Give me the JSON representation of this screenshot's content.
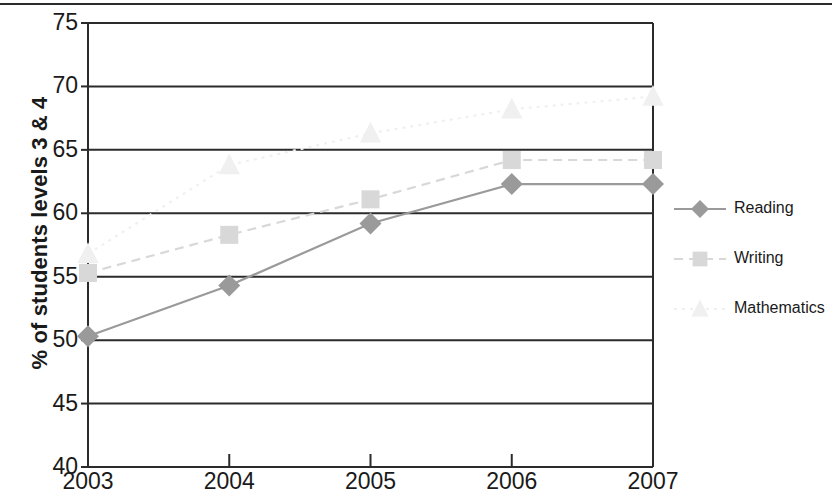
{
  "chart_data": {
    "type": "line",
    "title": "",
    "xlabel": "",
    "ylabel": "% of students levels 3 & 4",
    "categories": [
      "2003",
      "2004",
      "2005",
      "2006",
      "2007"
    ],
    "xticklabels": [
      "2003",
      "2004",
      "2005",
      "2006",
      "2007"
    ],
    "yticklabels": [
      "40",
      "45",
      "50",
      "55",
      "60",
      "65",
      "70",
      "75"
    ],
    "yticks": [
      40,
      45,
      50,
      55,
      60,
      65,
      70,
      75
    ],
    "ylim": [
      40,
      75
    ],
    "grid": "horizontal",
    "legend_position": "right",
    "series": [
      {
        "name": "Reading",
        "values": [
          50.3,
          54.3,
          59.2,
          62.3,
          62.3
        ],
        "color": "#9a9a9a",
        "marker": "diamond",
        "linestyle": "solid"
      },
      {
        "name": "Writing",
        "values": [
          55.3,
          58.3,
          61.1,
          64.2,
          64.2
        ],
        "color": "#d8d8d8",
        "marker": "square",
        "linestyle": "dashed"
      },
      {
        "name": "Mathematics",
        "values": [
          56.8,
          63.8,
          66.3,
          68.2,
          69.2
        ],
        "color": "#f0f0f0",
        "marker": "triangle",
        "linestyle": "dotted"
      }
    ]
  },
  "axes": {
    "axis_color": "#2b2b2b",
    "grid_color": "#2b2b2b",
    "background": "#ffffff"
  },
  "legend": {
    "items": [
      {
        "label": "Reading"
      },
      {
        "label": "Writing"
      },
      {
        "label": "Mathematics"
      }
    ]
  }
}
